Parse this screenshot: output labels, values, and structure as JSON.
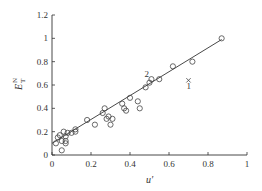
{
  "chart_data": {
    "type": "scatter",
    "title": "",
    "xlabel": "u'",
    "ylabel": "E_T^N",
    "xlim": [
      0,
      1
    ],
    "ylim": [
      0,
      1.2
    ],
    "grid": false,
    "x_ticks": [
      "0",
      "0.2",
      "0.4",
      "0.6",
      "0.8",
      "1"
    ],
    "y_ticks": [
      "0",
      "0.2",
      "0.4",
      "0.6",
      "0.8",
      "1",
      "1.2"
    ],
    "series": [
      {
        "name": "data (open circles)",
        "marker": "circle-open",
        "points": [
          [
            0.02,
            0.1
          ],
          [
            0.03,
            0.15
          ],
          [
            0.04,
            0.17
          ],
          [
            0.05,
            0.12
          ],
          [
            0.06,
            0.2
          ],
          [
            0.05,
            0.04
          ],
          [
            0.07,
            0.16
          ],
          [
            0.07,
            0.1
          ],
          [
            0.07,
            0.12
          ],
          [
            0.08,
            0.19
          ],
          [
            0.1,
            0.19
          ],
          [
            0.12,
            0.2
          ],
          [
            0.12,
            0.22
          ],
          [
            0.18,
            0.3
          ],
          [
            0.22,
            0.26
          ],
          [
            0.26,
            0.36
          ],
          [
            0.27,
            0.4
          ],
          [
            0.28,
            0.31
          ],
          [
            0.29,
            0.33
          ],
          [
            0.3,
            0.26
          ],
          [
            0.31,
            0.31
          ],
          [
            0.36,
            0.44
          ],
          [
            0.37,
            0.4
          ],
          [
            0.38,
            0.38
          ],
          [
            0.4,
            0.49
          ],
          [
            0.44,
            0.46
          ],
          [
            0.45,
            0.4
          ],
          [
            0.48,
            0.58
          ],
          [
            0.5,
            0.62
          ],
          [
            0.51,
            0.65
          ],
          [
            0.55,
            0.65
          ],
          [
            0.62,
            0.76
          ],
          [
            0.72,
            0.8
          ],
          [
            0.87,
            1.0
          ]
        ]
      },
      {
        "name": "outlier",
        "marker": "cross",
        "points": [
          [
            0.7,
            0.64
          ]
        ]
      },
      {
        "name": "linear fit",
        "marker": "line",
        "points": [
          [
            0.0,
            0.1
          ],
          [
            0.87,
            0.99
          ]
        ]
      }
    ],
    "annotations": [
      {
        "text": "1",
        "x": 0.7,
        "y": 0.57
      },
      {
        "text": "2",
        "x": 0.49,
        "y": 0.67
      }
    ]
  },
  "labels": {
    "xlabel": "u′",
    "ylabel_main": "E",
    "ylabel_sub": "T",
    "ylabel_sup": "N",
    "annot1": "1",
    "annot2": "2"
  }
}
